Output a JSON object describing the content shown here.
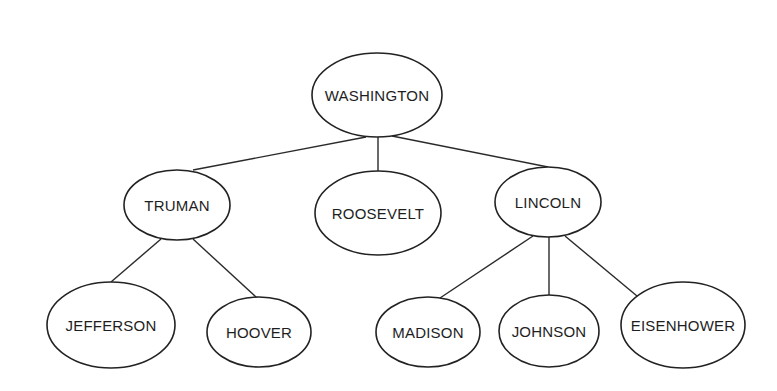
{
  "diagram": {
    "type": "tree",
    "colors": {
      "background": "#ffffff",
      "stroke": "#222222",
      "text": "#1e1e1e"
    },
    "nodes": [
      {
        "id": "washington",
        "label": "WASHINGTON",
        "cx": 377,
        "cy": 95,
        "rx": 65,
        "ry": 42
      },
      {
        "id": "truman",
        "label": "TRUMAN",
        "cx": 177,
        "cy": 205,
        "rx": 53,
        "ry": 35
      },
      {
        "id": "roosevelt",
        "label": "ROOSEVELT",
        "cx": 378,
        "cy": 213,
        "rx": 63,
        "ry": 42
      },
      {
        "id": "lincoln",
        "label": "LINCOLN",
        "cx": 548,
        "cy": 202,
        "rx": 53,
        "ry": 35
      },
      {
        "id": "jefferson",
        "label": "JEFFERSON",
        "cx": 111,
        "cy": 325,
        "rx": 64,
        "ry": 43
      },
      {
        "id": "hoover",
        "label": "HOOVER",
        "cx": 259,
        "cy": 332,
        "rx": 52,
        "ry": 35
      },
      {
        "id": "madison",
        "label": "MADISON",
        "cx": 428,
        "cy": 332,
        "rx": 52,
        "ry": 35
      },
      {
        "id": "johnson",
        "label": "JOHNSON",
        "cx": 549,
        "cy": 331,
        "rx": 50,
        "ry": 36
      },
      {
        "id": "eisenhower",
        "label": "EISENHOWER",
        "cx": 683,
        "cy": 325,
        "rx": 62,
        "ry": 43
      }
    ],
    "edges": [
      {
        "from": "washington",
        "to": "truman",
        "x1": 366,
        "y1": 137,
        "x2": 193,
        "y2": 170
      },
      {
        "from": "washington",
        "to": "roosevelt",
        "x1": 378,
        "y1": 137,
        "x2": 378,
        "y2": 171
      },
      {
        "from": "washington",
        "to": "lincoln",
        "x1": 392,
        "y1": 136,
        "x2": 548,
        "y2": 167
      },
      {
        "from": "truman",
        "to": "jefferson",
        "x1": 161,
        "y1": 239,
        "x2": 111,
        "y2": 282
      },
      {
        "from": "truman",
        "to": "hoover",
        "x1": 193,
        "y1": 239,
        "x2": 256,
        "y2": 297
      },
      {
        "from": "lincoln",
        "to": "madison",
        "x1": 533,
        "y1": 236,
        "x2": 440,
        "y2": 298
      },
      {
        "from": "lincoln",
        "to": "johnson",
        "x1": 549,
        "y1": 237,
        "x2": 549,
        "y2": 295
      },
      {
        "from": "lincoln",
        "to": "eisenhower",
        "x1": 565,
        "y1": 236,
        "x2": 637,
        "y2": 296
      }
    ]
  }
}
